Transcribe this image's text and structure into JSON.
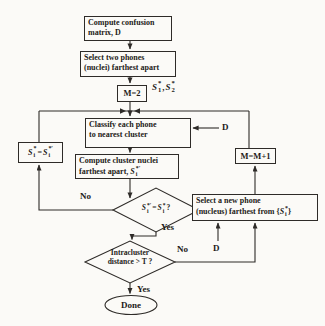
{
  "figure": {
    "type": "flowchart",
    "background": "#fbfaf7",
    "ink": "#2e2b28",
    "nodes": {
      "confusion": {
        "line1": "Compute confusion",
        "line2": "matrix, D"
      },
      "select_two": {
        "line1": "Select two phones",
        "line2": "(nuclei) farthest apart"
      },
      "m_init": {
        "label": "M=2"
      },
      "classify": {
        "line1": "Classify each phone",
        "line2": "to nearest cluster"
      },
      "compute_nuclei": {
        "line1": "Compute cluster nuclei",
        "line2_prefix": "farthest apart, "
      },
      "m_increment": {
        "label": "M=M+1"
      },
      "select_new": {
        "line1": "Select a new phone",
        "line2_prefix": "(nucleus) farthest from {",
        "line2_suffix": "}"
      },
      "intracluster": {
        "line1": "Intracluster",
        "line2": "distance > T ?"
      },
      "done": {
        "label": "Done"
      }
    },
    "math": {
      "s1": {
        "base": "S",
        "sup": "*",
        "sub": "1"
      },
      "s2": {
        "base": "S",
        "sup": "*",
        "sub": "2"
      },
      "s_new": {
        "base": "S",
        "sup": "*′",
        "sub": "i"
      },
      "s_cur": {
        "base": "S",
        "sup": "*",
        "sub": "i"
      },
      "comma": ",",
      "eq": "=",
      "q": "?"
    },
    "labels": {
      "no_converged": "No",
      "yes_converged": "Yes",
      "no_distance": "No",
      "yes_distance": "Yes",
      "d_classify": "D",
      "d_select": "D"
    }
  }
}
